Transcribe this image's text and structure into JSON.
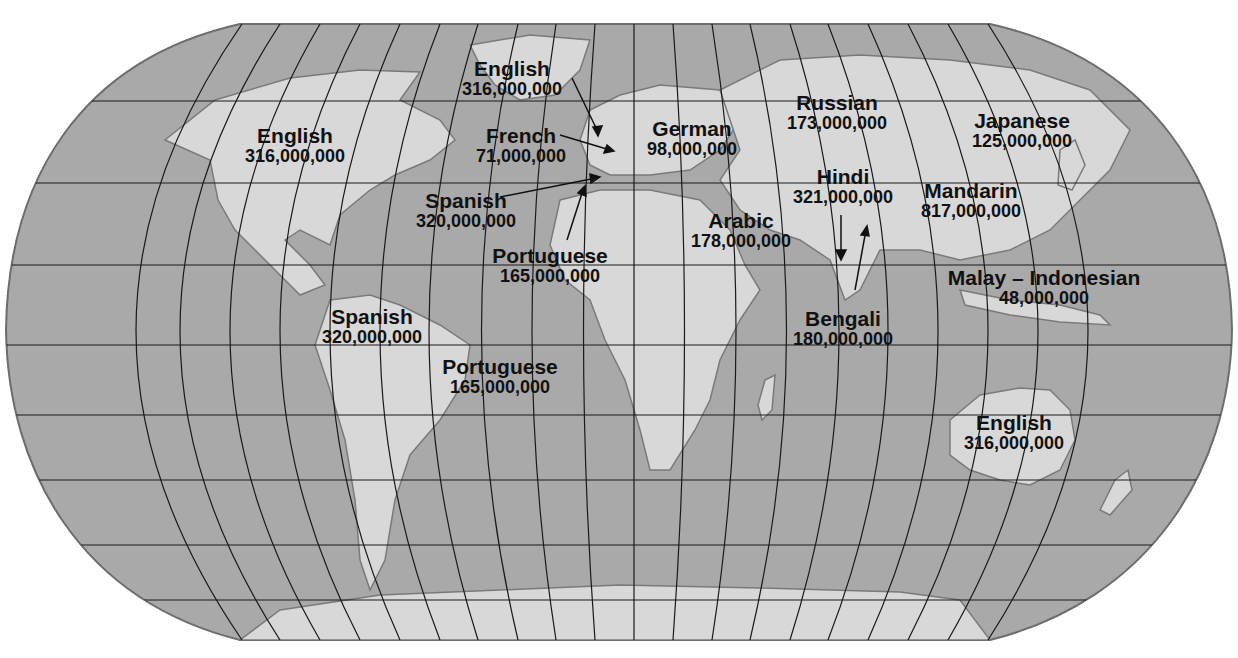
{
  "map": {
    "projection": "Robinson-style world map",
    "colors": {
      "ocean": "#a9a9a9",
      "land": "#d8d8d8",
      "grid": "#1a1a1a",
      "border": "#7a7a7a",
      "text": "#111111"
    }
  },
  "labels": [
    {
      "id": "english-north-america",
      "language": "English",
      "speakers": "316,000,000",
      "x": 295,
      "y": 125
    },
    {
      "id": "english-uk",
      "language": "English",
      "speakers": "316,000,000",
      "x": 512,
      "y": 58
    },
    {
      "id": "french",
      "language": "French",
      "speakers": "71,000,000",
      "x": 521,
      "y": 125
    },
    {
      "id": "spanish-spain",
      "language": "Spanish",
      "speakers": "320,000,000",
      "x": 466,
      "y": 190
    },
    {
      "id": "portuguese-portugal",
      "language": "Portuguese",
      "speakers": "165,000,000",
      "x": 550,
      "y": 245
    },
    {
      "id": "german",
      "language": "German",
      "speakers": "98,000,000",
      "x": 692,
      "y": 118
    },
    {
      "id": "russian",
      "language": "Russian",
      "speakers": "173,000,000",
      "x": 837,
      "y": 92
    },
    {
      "id": "japanese",
      "language": "Japanese",
      "speakers": "125,000,000",
      "x": 1022,
      "y": 110
    },
    {
      "id": "hindi",
      "language": "Hindi",
      "speakers": "321,000,000",
      "x": 843,
      "y": 166
    },
    {
      "id": "mandarin",
      "language": "Mandarin",
      "speakers": "817,000,000",
      "x": 971,
      "y": 180
    },
    {
      "id": "arabic",
      "language": "Arabic",
      "speakers": "178,000,000",
      "x": 741,
      "y": 210
    },
    {
      "id": "malay-indonesian",
      "language": "Malay – Indonesian",
      "speakers": "48,000,000",
      "x": 1044,
      "y": 267
    },
    {
      "id": "bengali",
      "language": "Bengali",
      "speakers": "180,000,000",
      "x": 843,
      "y": 308
    },
    {
      "id": "spanish-south-america",
      "language": "Spanish",
      "speakers": "320,000,000",
      "x": 372,
      "y": 306
    },
    {
      "id": "portuguese-brazil",
      "language": "Portuguese",
      "speakers": "165,000,000",
      "x": 500,
      "y": 356
    },
    {
      "id": "english-australia",
      "language": "English",
      "speakers": "316,000,000",
      "x": 1014,
      "y": 412
    }
  ]
}
